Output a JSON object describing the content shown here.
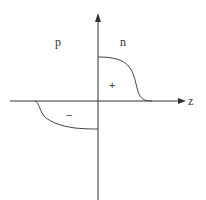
{
  "diagram": {
    "region_labels": {
      "left": "p",
      "right": "n"
    },
    "axis": {
      "horizontal_label": "z"
    },
    "charge_signs": {
      "positive": "+",
      "negative": "−"
    },
    "colors": {
      "axis": "#333333",
      "curve": "#444444",
      "background": "#ffffff"
    }
  }
}
